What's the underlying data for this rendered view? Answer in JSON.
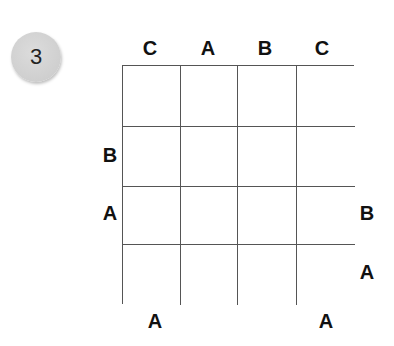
{
  "puzzle": {
    "number": "3",
    "size": 4,
    "clues": {
      "top": [
        "C",
        "A",
        "B",
        "C"
      ],
      "left": [
        "",
        "B",
        "A",
        ""
      ],
      "right": [
        "",
        "",
        "B",
        "A"
      ],
      "bottom": [
        "A",
        "",
        "",
        "A"
      ]
    },
    "cells": [
      [
        "",
        "",
        "",
        ""
      ],
      [
        "",
        "",
        "",
        ""
      ],
      [
        "",
        "",
        "",
        ""
      ],
      [
        "",
        "",
        "",
        ""
      ]
    ]
  }
}
